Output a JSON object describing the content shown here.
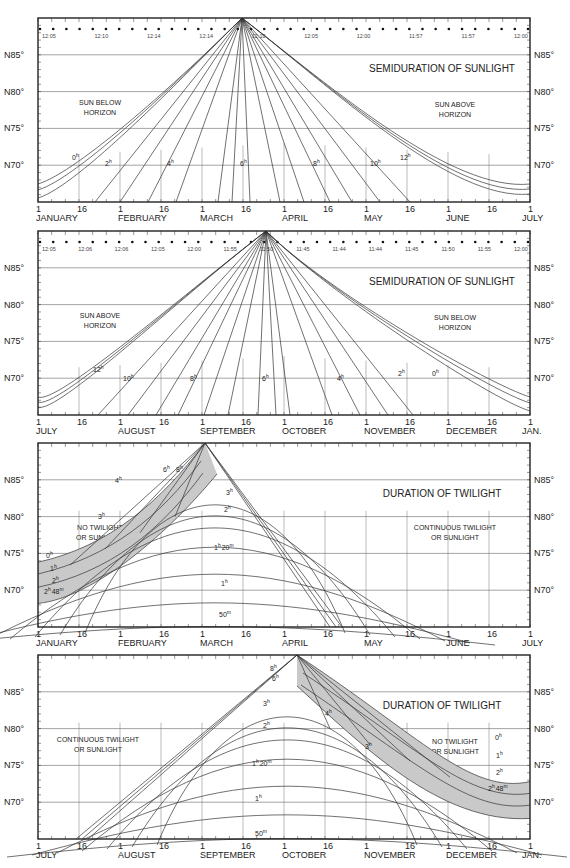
{
  "chart_data": [
    {
      "type": "line",
      "title": "SEMIDURATION OF SUNLIGHT",
      "period": "January to July",
      "x_tick_days": [
        "1",
        "16",
        "1",
        "16",
        "1",
        "16",
        "1",
        "16",
        "1",
        "16",
        "1",
        "16",
        "1"
      ],
      "x_month_labels": [
        "JANUARY",
        "FEBRUARY",
        "MARCH",
        "APRIL",
        "MAY",
        "JUNE",
        "JULY"
      ],
      "ylabel_ticks": [
        "N85°",
        "N80°",
        "N75°",
        "N70°"
      ],
      "ylim": [
        65,
        90
      ],
      "region_labels": [
        {
          "text": [
            "SUN BELOW",
            "HORIZON"
          ],
          "side": "left"
        },
        {
          "text": [
            "SUN ABOVE",
            "HORIZON"
          ],
          "side": "right"
        }
      ],
      "meridian_passage_times": [
        "12:05",
        "12:10",
        "12:14",
        "12:14",
        "12:10",
        "12:05",
        "12:00",
        "11:57",
        "11:57",
        "12:00"
      ],
      "series": [
        {
          "name": "0h",
          "label": "0h"
        },
        {
          "name": "2h",
          "label": "2h"
        },
        {
          "name": "4h",
          "label": "4h"
        },
        {
          "name": "6h",
          "label": "6h"
        },
        {
          "name": "8h",
          "label": "8h"
        },
        {
          "name": "10h",
          "label": "10h"
        },
        {
          "name": "12h",
          "label": "12h"
        }
      ]
    },
    {
      "type": "line",
      "title": "SEMIDURATION OF SUNLIGHT",
      "period": "July to January",
      "x_tick_days": [
        "1",
        "16",
        "1",
        "16",
        "1",
        "16",
        "1",
        "16",
        "1",
        "16",
        "1",
        "16",
        "1"
      ],
      "x_month_labels": [
        "JULY",
        "AUGUST",
        "SEPTEMBER",
        "OCTOBER",
        "NOVEMBER",
        "DECEMBER",
        "JAN."
      ],
      "ylabel_ticks": [
        "N85°",
        "N80°",
        "N75°",
        "N70°"
      ],
      "ylim": [
        65,
        90
      ],
      "region_labels": [
        {
          "text": [
            "SUN ABOVE",
            "HORIZON"
          ],
          "side": "left"
        },
        {
          "text": [
            "SUN BELOW",
            "HORIZON"
          ],
          "side": "right"
        }
      ],
      "meridian_passage_times": [
        "12:05",
        "12:06",
        "12:06",
        "12:05",
        "12:00",
        "11:55",
        "11:50",
        "11:45",
        "11:44",
        "11:44",
        "11:45",
        "11:50",
        "11:55",
        "12:00"
      ],
      "series": [
        {
          "name": "12h",
          "label": "12h"
        },
        {
          "name": "10h",
          "label": "10h"
        },
        {
          "name": "8h",
          "label": "8h"
        },
        {
          "name": "6h",
          "label": "6h"
        },
        {
          "name": "4h",
          "label": "4h"
        },
        {
          "name": "2h",
          "label": "2h"
        },
        {
          "name": "0h",
          "label": "0h"
        }
      ]
    },
    {
      "type": "line",
      "title": "DURATION OF TWILIGHT",
      "period": "January to July",
      "x_tick_days": [
        "1",
        "16",
        "1",
        "16",
        "1",
        "16",
        "1",
        "16",
        "1",
        "16",
        "1",
        "16",
        "1"
      ],
      "x_month_labels": [
        "JANUARY",
        "FEBRUARY",
        "MARCH",
        "APRIL",
        "MAY",
        "JUNE",
        "JULY"
      ],
      "ylabel_ticks": [
        "N85°",
        "N80°",
        "N75°",
        "N70°"
      ],
      "ylim": [
        65,
        90
      ],
      "region_labels": [
        {
          "text": [
            "NO TWILIGHT",
            "OR SUNLIGHT"
          ],
          "side": "left"
        },
        {
          "text": [
            "CONTINUOUS TWILIGHT",
            "OR SUNLIGHT"
          ],
          "side": "right"
        }
      ],
      "series": [
        {
          "name": "0h",
          "label": "0h"
        },
        {
          "name": "1h",
          "label": "1h"
        },
        {
          "name": "2h",
          "label": "2h"
        },
        {
          "name": "2h 48m",
          "label": "2h 48m"
        },
        {
          "name": "3h",
          "label": "3h"
        },
        {
          "name": "4h",
          "label": "4h"
        },
        {
          "name": "6h",
          "label": "6h"
        },
        {
          "name": "8h",
          "label": "8h"
        },
        {
          "name": "1h 20m",
          "label": "1h 20m"
        },
        {
          "name": "1h peak",
          "label": "1h"
        },
        {
          "name": "50m",
          "label": "50m"
        }
      ]
    },
    {
      "type": "line",
      "title": "DURATION OF TWILIGHT",
      "period": "July to January",
      "x_tick_days": [
        "1",
        "16",
        "1",
        "16",
        "1",
        "16",
        "1",
        "16",
        "1",
        "16",
        "1",
        "16",
        "1"
      ],
      "x_month_labels": [
        "JULY",
        "AUGUST",
        "SEPTEMBER",
        "OCTOBER",
        "NOVEMBER",
        "DECEMBER",
        "JAN."
      ],
      "ylabel_ticks": [
        "N85°",
        "N80°",
        "N75°",
        "N70°"
      ],
      "ylim": [
        65,
        90
      ],
      "region_labels": [
        {
          "text": [
            "CONTINUOUS TWILIGHT",
            "OR SUNLIGHT"
          ],
          "side": "left"
        },
        {
          "text": [
            "NO TWILIGHT",
            "OR SUNLIGHT"
          ],
          "side": "right"
        }
      ],
      "series": [
        {
          "name": "8h",
          "label": "8h"
        },
        {
          "name": "6h",
          "label": "6h"
        },
        {
          "name": "4h",
          "label": "4h"
        },
        {
          "name": "3h",
          "label": "3h"
        },
        {
          "name": "2h",
          "label": "2h"
        },
        {
          "name": "1h 20m",
          "label": "1h 20m"
        },
        {
          "name": "1h",
          "label": "1h"
        },
        {
          "name": "50m",
          "label": "50m"
        },
        {
          "name": "0h",
          "label": "0h"
        },
        {
          "name": "1h (right)",
          "label": "1h"
        },
        {
          "name": "2h (right)",
          "label": "2h"
        },
        {
          "name": "2h 48m",
          "label": "2h 48m"
        }
      ]
    }
  ],
  "panels": [
    {
      "title": "SEMIDURATION OF SUNLIGHT",
      "left_region": [
        "SUN BELOW",
        "HORIZON"
      ],
      "right_region": [
        "SUN ABOVE",
        "HORIZON"
      ],
      "months": [
        "JANUARY",
        "FEBRUARY",
        "MARCH",
        "APRIL",
        "MAY",
        "JUNE",
        "JULY"
      ],
      "days": [
        "1",
        "16",
        "1",
        "16",
        "1",
        "16",
        "1",
        "16",
        "1",
        "16",
        "1",
        "16",
        "1"
      ],
      "ylabels": [
        "N85°",
        "N80°",
        "N75°",
        "N70°"
      ],
      "curve_labels": [
        "0h",
        "2h",
        "4h",
        "6h",
        "8h",
        "10h",
        "12h"
      ],
      "times": [
        "12:05",
        "12:10",
        "12:14",
        "12:14",
        "12:10",
        "12:05",
        "12:00",
        "11:57",
        "11:57",
        "12:00"
      ]
    },
    {
      "title": "SEMIDURATION OF SUNLIGHT",
      "left_region": [
        "SUN ABOVE",
        "HORIZON"
      ],
      "right_region": [
        "SUN BELOW",
        "HORIZON"
      ],
      "months": [
        "JULY",
        "AUGUST",
        "SEPTEMBER",
        "OCTOBER",
        "NOVEMBER",
        "DECEMBER",
        "JAN."
      ],
      "days": [
        "1",
        "16",
        "1",
        "16",
        "1",
        "16",
        "1",
        "16",
        "1",
        "16",
        "1",
        "16",
        "1"
      ],
      "ylabels": [
        "N85°",
        "N80°",
        "N75°",
        "N70°"
      ],
      "curve_labels": [
        "12h",
        "10h",
        "8h",
        "6h",
        "4h",
        "2h",
        "0h"
      ],
      "times": [
        "12:05",
        "12:06",
        "12:06",
        "12:05",
        "12:00",
        "11:55",
        "11:50",
        "11:45",
        "11:44",
        "11:44",
        "11:45",
        "11:50",
        "11:55",
        "12:00"
      ]
    },
    {
      "title": "DURATION OF TWILIGHT",
      "left_region": [
        "NO TWILIGHT",
        "OR SUNLIGHT"
      ],
      "right_region": [
        "CONTINUOUS TWILIGHT",
        "OR SUNLIGHT"
      ],
      "months": [
        "JANUARY",
        "FEBRUARY",
        "MARCH",
        "APRIL",
        "MAY",
        "JUNE",
        "JULY"
      ],
      "days": [
        "1",
        "16",
        "1",
        "16",
        "1",
        "16",
        "1",
        "16",
        "1",
        "16",
        "1",
        "16",
        "1"
      ],
      "ylabels": [
        "N85°",
        "N80°",
        "N75°",
        "N70°"
      ],
      "curve_labels": [
        "0h",
        "1h",
        "2h",
        "2h48m",
        "3h",
        "4h",
        "6h",
        "8h",
        "3h",
        "2h",
        "1h20m",
        "1h",
        "50m"
      ]
    },
    {
      "title": "DURATION OF TWILIGHT",
      "left_region": [
        "CONTINUOUS TWILIGHT",
        "OR SUNLIGHT"
      ],
      "right_region": [
        "NO TWILIGHT",
        "OR SUNLIGHT"
      ],
      "months": [
        "JULY",
        "AUGUST",
        "SEPTEMBER",
        "OCTOBER",
        "NOVEMBER",
        "DECEMBER",
        "JAN."
      ],
      "days": [
        "1",
        "16",
        "1",
        "16",
        "1",
        "16",
        "1",
        "16",
        "1",
        "16",
        "1",
        "16",
        "1"
      ],
      "ylabels": [
        "N85°",
        "N80°",
        "N75°",
        "N70°"
      ],
      "curve_labels": [
        "8h",
        "6h",
        "3h",
        "2h",
        "1h20m",
        "1h",
        "50m",
        "4h",
        "3h",
        "0h",
        "1h",
        "2h",
        "2h48m"
      ]
    }
  ]
}
